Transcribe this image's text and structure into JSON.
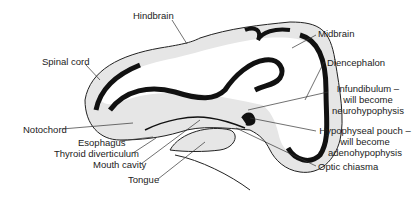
{
  "diagram": {
    "labels": {
      "hindbrain": "Hindbrain",
      "midbrain": "Midbrain",
      "spinal_cord": "Spinal cord",
      "diencephalon": "Diencephalon",
      "infundibulum_line1": "Infundibulum –",
      "infundibulum_line2": "will become",
      "infundibulum_line3": "neurohypophysis",
      "notochord": "Notochord",
      "esophagus": "Esophagus",
      "thyroid_diverticulum": "Thyroid diverticulum",
      "mouth_cavity": "Mouth cavity",
      "tongue": "Tongue",
      "hypophyseal_line1": "Hypophyseal pouch –",
      "hypophyseal_line2": "will become",
      "hypophyseal_line3": "adenohypophysis",
      "optic_chiasma": "Optic chiasma"
    },
    "colors": {
      "fill": "#e6e6e6",
      "wall": "#111111",
      "leader": "#333333"
    }
  }
}
